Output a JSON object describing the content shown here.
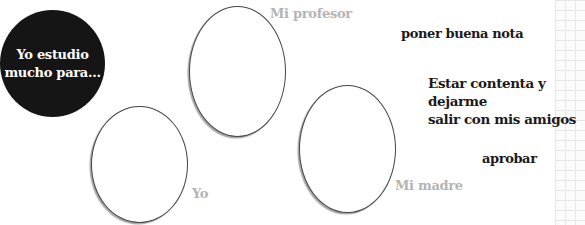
{
  "diagram": {
    "prompt": "Yo estudio\nmucho para...",
    "nodes": [
      {
        "id": "profesor",
        "label": "Mi profesor"
      },
      {
        "id": "yo",
        "label": "Yo"
      },
      {
        "id": "madre",
        "label": "Mi madre"
      }
    ],
    "goals": [
      {
        "text": "poner buena nota"
      },
      {
        "text": "Estar contenta y dejarme\nsalir con mis amigos"
      },
      {
        "text": "aprobar"
      }
    ]
  },
  "colors": {
    "circle_fill": "#151515",
    "node_label": "#b4b4b4",
    "goal_text": "#1a1a1a",
    "ellipse_stroke": "#444444",
    "grid_line": "#e6e6e6"
  }
}
